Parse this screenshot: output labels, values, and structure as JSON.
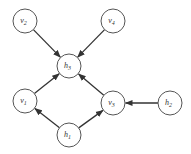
{
  "diagram": {
    "type": "directed-graph",
    "colors": {
      "stroke": "#555555",
      "edge": "#333333",
      "text": "#333333",
      "background": "#ffffff"
    },
    "node_radius": 12,
    "nodes": [
      {
        "id": "v2",
        "base": "v",
        "sub": "2",
        "x": 25,
        "y": 21
      },
      {
        "id": "v4",
        "base": "v",
        "sub": "4",
        "x": 113,
        "y": 21
      },
      {
        "id": "h3",
        "base": "h",
        "sub": "3",
        "x": 69,
        "y": 66
      },
      {
        "id": "v1",
        "base": "v",
        "sub": "1",
        "x": 25,
        "y": 101
      },
      {
        "id": "v3",
        "base": "v",
        "sub": "3",
        "x": 113,
        "y": 103
      },
      {
        "id": "h2",
        "base": "h",
        "sub": "2",
        "x": 170,
        "y": 103
      },
      {
        "id": "h1",
        "base": "h",
        "sub": "1",
        "x": 69,
        "y": 135
      }
    ],
    "edges": [
      {
        "from": "v2",
        "to": "h3"
      },
      {
        "from": "v4",
        "to": "h3"
      },
      {
        "from": "v1",
        "to": "h3"
      },
      {
        "from": "v3",
        "to": "h3"
      },
      {
        "from": "h1",
        "to": "v1"
      },
      {
        "from": "h1",
        "to": "v3"
      },
      {
        "from": "h2",
        "to": "v3"
      }
    ]
  }
}
